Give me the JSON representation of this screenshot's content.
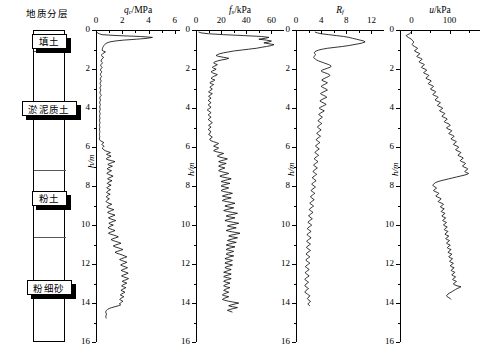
{
  "geology": {
    "title": "地质分层",
    "layers": [
      {
        "label": "填土",
        "top_m": 0.0,
        "bottom_m": 1.1
      },
      {
        "label": "淤泥质土",
        "top_m": 1.1,
        "bottom_m": 7.2
      },
      {
        "label": "粉土",
        "top_m": 7.2,
        "bottom_m": 10.6
      },
      {
        "label": "粉细砂",
        "top_m": 10.6,
        "bottom_m": 16.0
      }
    ],
    "label_depths_m": [
      0.55,
      4.0,
      8.6,
      13.2
    ]
  },
  "depth_axis": {
    "label": "h/m",
    "min": 0,
    "max": 16,
    "ticks": [
      0,
      2,
      4,
      6,
      8,
      10,
      12,
      14,
      16
    ],
    "minor_step": 1
  },
  "chart_data": [
    {
      "type": "line",
      "title": "q",
      "title_sub": "c",
      "title_unit": "/MPa",
      "xlabel": "q_c/MPa",
      "ylabel": "h/m",
      "xlim": [
        0,
        6.4
      ],
      "ylim": [
        0,
        16
      ],
      "xticks": [
        0,
        2,
        4,
        6
      ],
      "xminor": [
        1,
        3,
        5
      ],
      "grid": false,
      "x": [
        0.05,
        0.1,
        0.25,
        0.45,
        1.6,
        3.4,
        4.3,
        3.9,
        3.1,
        2.1,
        1.45,
        1.05,
        0.85,
        0.72,
        0.66,
        0.6,
        0.56,
        0.52,
        0.5,
        0.48,
        0.46,
        0.55,
        0.72,
        0.62,
        0.5,
        0.44,
        0.42,
        0.46,
        0.58,
        0.52,
        0.44,
        0.4,
        0.38,
        0.42,
        0.5,
        0.44,
        0.38,
        0.36,
        0.4,
        0.46,
        0.42,
        0.36,
        0.34,
        0.38,
        0.44,
        0.4,
        0.35,
        0.33,
        0.36,
        0.42,
        0.38,
        0.34,
        0.32,
        0.35,
        0.4,
        0.36,
        0.33,
        0.31,
        0.34,
        0.38,
        0.35,
        0.32,
        0.3,
        0.33,
        0.37,
        0.34,
        0.31,
        0.3,
        0.32,
        0.36,
        0.4,
        0.34,
        0.3,
        0.29,
        0.31,
        0.35,
        0.32,
        0.29,
        0.28,
        0.3,
        0.34,
        0.31,
        0.29,
        0.28,
        0.3,
        0.33,
        0.3,
        0.28,
        0.27,
        0.29,
        0.32,
        0.3,
        0.28,
        0.27,
        0.29,
        0.31,
        0.29,
        0.27,
        0.27,
        0.28,
        0.31,
        0.29,
        0.27,
        0.26,
        0.28,
        0.3,
        0.28,
        0.27,
        0.26,
        0.28,
        0.3,
        0.28,
        0.27,
        0.26,
        0.27,
        0.29,
        0.28,
        0.26,
        0.26,
        0.28,
        0.34,
        0.46,
        0.6,
        0.52,
        0.44,
        0.5,
        0.62,
        0.55,
        0.48,
        0.52,
        0.6,
        0.7,
        0.9,
        1.1,
        0.95,
        0.8,
        0.95,
        1.15,
        1.0,
        0.85,
        0.78,
        0.92,
        1.2,
        1.45,
        1.25,
        1.05,
        0.9,
        1.0,
        1.25,
        1.1,
        0.92,
        0.85,
        0.98,
        1.18,
        1.05,
        0.9,
        0.82,
        0.95,
        1.12,
        1.3,
        1.15,
        0.98,
        0.88,
        1.02,
        1.22,
        1.08,
        0.92,
        0.85,
        0.98,
        1.15,
        1.0,
        0.88,
        0.82,
        0.95,
        1.1,
        0.96,
        0.86,
        0.8,
        0.92,
        1.08,
        0.94,
        0.84,
        0.78,
        0.88,
        1.02,
        0.9,
        0.82,
        0.76,
        0.86,
        1.0,
        1.2,
        1.05,
        0.9,
        0.82,
        0.94,
        1.15,
        1.35,
        1.18,
        1.0,
        0.88,
        1.0,
        1.22,
        1.45,
        1.28,
        1.1,
        0.95,
        1.08,
        1.3,
        1.5,
        1.32,
        1.12,
        0.98,
        1.1,
        1.32,
        1.15,
        1.0,
        0.92,
        1.05,
        1.25,
        1.45,
        1.28,
        1.08,
        0.95,
        1.1,
        1.35,
        1.55,
        1.7,
        1.5,
        1.3,
        1.15,
        1.28,
        1.5,
        1.72,
        1.9,
        1.7,
        1.48,
        1.32,
        1.45,
        1.68,
        1.88,
        2.05,
        1.85,
        1.62,
        1.45,
        1.58,
        1.8,
        2.0,
        2.18,
        2.35,
        2.15,
        1.95,
        1.8,
        1.95,
        2.15,
        2.35,
        2.2,
        2.0,
        1.88,
        2.02,
        2.22,
        2.4,
        2.25,
        2.05,
        1.92,
        2.08,
        2.28,
        2.45,
        2.3,
        2.1,
        1.95,
        2.1,
        2.3,
        2.48,
        2.35,
        2.15,
        2.0,
        2.15,
        2.35,
        2.2,
        2.05,
        1.95,
        2.1,
        2.28,
        2.15,
        2.0,
        1.9,
        2.05,
        2.2,
        2.08,
        1.95,
        1.85,
        1.98,
        2.12,
        2.0,
        1.88,
        1.8,
        1.92,
        2.05,
        1.95,
        1.85,
        1.78,
        1.88,
        1.7,
        1.45,
        1.2,
        1.0,
        0.88,
        0.8,
        0.76,
        0.74,
        0.76,
        0.8,
        0.78,
        0.76,
        0.75,
        0.76,
        0.78
      ],
      "y_start": 0.1,
      "y_step": 0.0465
    },
    {
      "type": "line",
      "title": "f",
      "title_sub": "s",
      "title_unit": "/kPa",
      "xlabel": "f_s/kPa",
      "ylabel": "h/m",
      "xlim": [
        0,
        70
      ],
      "ylim": [
        0,
        16
      ],
      "xticks": [
        0,
        20,
        40,
        60
      ],
      "xminor": [
        10,
        30,
        50
      ],
      "grid": false,
      "x": [
        2,
        4,
        10,
        22,
        38,
        52,
        58,
        55,
        50,
        56,
        60,
        58,
        54,
        58,
        62,
        60,
        56,
        52,
        48,
        42,
        36,
        30,
        26,
        22,
        19,
        17,
        16,
        18,
        22,
        26,
        24,
        20,
        17,
        15,
        14,
        15,
        17,
        16,
        14,
        13,
        14,
        16,
        15,
        13,
        12,
        13,
        15,
        17,
        16,
        14,
        13,
        12,
        13,
        15,
        14,
        12,
        11,
        12,
        14,
        13,
        12,
        11,
        12,
        13,
        12,
        11,
        10,
        11,
        13,
        12,
        11,
        10,
        11,
        12,
        11,
        10,
        10,
        11,
        12,
        11,
        10,
        10,
        11,
        12,
        11,
        10,
        9,
        10,
        11,
        12,
        11,
        10,
        10,
        11,
        12,
        11,
        10,
        10,
        11,
        12,
        13,
        12,
        11,
        10,
        11,
        12,
        11,
        10,
        10,
        11,
        12,
        11,
        11,
        10,
        11,
        12,
        13,
        12,
        11,
        11,
        12,
        14,
        16,
        18,
        17,
        15,
        14,
        16,
        18,
        17,
        15,
        14,
        16,
        19,
        22,
        20,
        18,
        17,
        19,
        22,
        25,
        23,
        20,
        18,
        20,
        24,
        22,
        19,
        18,
        20,
        23,
        21,
        19,
        18,
        20,
        23,
        26,
        24,
        21,
        19,
        21,
        25,
        28,
        25,
        22,
        20,
        23,
        27,
        24,
        21,
        20,
        23,
        26,
        24,
        21,
        20,
        22,
        26,
        29,
        26,
        23,
        21,
        24,
        28,
        25,
        22,
        21,
        24,
        28,
        31,
        28,
        25,
        23,
        26,
        30,
        27,
        24,
        22,
        25,
        29,
        33,
        30,
        26,
        24,
        27,
        31,
        28,
        25,
        23,
        26,
        30,
        34,
        31,
        27,
        25,
        28,
        32,
        29,
        26,
        24,
        27,
        31,
        35,
        32,
        28,
        26,
        29,
        33,
        30,
        27,
        25,
        28,
        32,
        29,
        26,
        24,
        27,
        31,
        28,
        25,
        24,
        27,
        30,
        28,
        25,
        24,
        26,
        30,
        27,
        25,
        23,
        26,
        29,
        27,
        24,
        23,
        26,
        29,
        27,
        24,
        23,
        25,
        28,
        26,
        24,
        22,
        25,
        28,
        26,
        23,
        22,
        25,
        28,
        26,
        23,
        22,
        24,
        27,
        25,
        23,
        22,
        24,
        27,
        25,
        23,
        22,
        24,
        26,
        24,
        22,
        21,
        23,
        26,
        24,
        22,
        21,
        23,
        26,
        30,
        34,
        31,
        28,
        26,
        29,
        33,
        30,
        27,
        25,
        27,
        29
      ],
      "y_start": 0.1,
      "y_step": 0.0465
    },
    {
      "type": "line",
      "title": "R",
      "title_sub": "f",
      "title_unit": "",
      "xlabel": "R_f",
      "ylabel": "h/m",
      "xlim": [
        0,
        14
      ],
      "ylim": [
        0,
        16
      ],
      "xticks": [
        0,
        4,
        8,
        12
      ],
      "xminor": [
        2,
        6,
        10
      ],
      "grid": false,
      "x": [
        3.0,
        3.4,
        4.0,
        5.2,
        6.4,
        7.6,
        8.4,
        9.0,
        9.6,
        10.2,
        10.8,
        11.0,
        10.6,
        10.0,
        9.2,
        8.4,
        7.4,
        6.2,
        5.0,
        4.2,
        3.6,
        3.2,
        3.0,
        2.9,
        3.0,
        3.1,
        3.0,
        2.9,
        2.8,
        2.9,
        3.1,
        3.3,
        3.6,
        4.0,
        4.4,
        4.8,
        5.2,
        5.5,
        5.6,
        5.4,
        5.0,
        4.6,
        4.2,
        4.0,
        4.2,
        4.6,
        5.0,
        5.3,
        5.4,
        5.2,
        4.9,
        4.6,
        4.3,
        4.1,
        4.3,
        4.7,
        5.0,
        4.8,
        4.5,
        4.2,
        4.0,
        4.2,
        4.5,
        4.8,
        5.0,
        4.7,
        4.4,
        4.1,
        3.9,
        4.1,
        4.4,
        4.7,
        4.9,
        4.6,
        4.3,
        4.0,
        3.8,
        4.0,
        4.3,
        4.6,
        4.8,
        4.5,
        4.2,
        3.9,
        3.7,
        3.9,
        4.2,
        4.5,
        4.3,
        4.0,
        3.8,
        3.6,
        3.8,
        4.0,
        4.2,
        4.0,
        3.8,
        3.6,
        3.5,
        3.7,
        3.9,
        4.1,
        3.9,
        3.7,
        3.5,
        3.4,
        3.6,
        3.8,
        4.0,
        3.8,
        3.6,
        3.4,
        3.3,
        3.5,
        3.7,
        3.9,
        3.7,
        3.5,
        3.3,
        3.2,
        3.4,
        3.6,
        3.8,
        3.6,
        3.4,
        3.2,
        3.1,
        3.3,
        3.5,
        3.7,
        3.5,
        3.3,
        3.1,
        3.0,
        3.2,
        3.4,
        3.6,
        3.4,
        3.2,
        3.0,
        2.9,
        3.1,
        3.3,
        3.5,
        3.3,
        3.1,
        2.9,
        2.8,
        3.0,
        3.2,
        3.4,
        3.2,
        3.0,
        2.8,
        2.7,
        2.9,
        3.1,
        3.3,
        3.1,
        2.9,
        2.7,
        2.6,
        2.8,
        3.0,
        3.2,
        3.0,
        2.8,
        2.6,
        2.5,
        2.7,
        2.9,
        3.1,
        2.9,
        2.7,
        2.5,
        2.4,
        2.6,
        2.8,
        3.0,
        2.8,
        2.6,
        2.4,
        2.3,
        2.5,
        2.7,
        2.9,
        2.7,
        2.5,
        2.3,
        2.2,
        2.4,
        2.6,
        2.8,
        2.6,
        2.4,
        2.2,
        2.1,
        2.3,
        2.5,
        2.7,
        2.5,
        2.3,
        2.1,
        2.0,
        2.2,
        2.4,
        2.6,
        2.4,
        2.2,
        2.0,
        1.9,
        2.1,
        2.3,
        2.5,
        2.3,
        2.1,
        1.9,
        1.8,
        2.0,
        2.2,
        2.4,
        2.2,
        2.0,
        1.8,
        1.8,
        2.0,
        2.2,
        2.4,
        2.2,
        2.0,
        1.8,
        1.7,
        1.9,
        2.1,
        2.3,
        2.1,
        1.9,
        1.7,
        1.7,
        1.9,
        2.1,
        2.3,
        2.1,
        1.9,
        1.7,
        1.6,
        1.8,
        2.0,
        2.2,
        2.0,
        1.8,
        1.6,
        1.6,
        1.8,
        2.0,
        2.2,
        2.0,
        1.8,
        1.6,
        1.5,
        1.7,
        1.9,
        2.1,
        1.9,
        1.7,
        1.5,
        1.5,
        1.7,
        1.9,
        2.1,
        1.9,
        1.7,
        1.5,
        1.4,
        1.6,
        1.8,
        2.0,
        1.8,
        1.6,
        1.5,
        1.4,
        1.6,
        1.8,
        2.0,
        1.8,
        1.6,
        1.5,
        1.4,
        1.6,
        1.8,
        2.0,
        2.2,
        2.1,
        1.9,
        1.8,
        1.9,
        2.1,
        2.3,
        2.2,
        2.0,
        1.9,
        2.0,
        2.2
      ],
      "y_start": 0.1,
      "y_step": 0.0465
    },
    {
      "type": "line",
      "title": "u/kPa",
      "title_sub": "",
      "title_unit": "",
      "xlabel": "u/kPa",
      "ylabel": "h/m",
      "xlim": [
        -30,
        180
      ],
      "ylim": [
        0,
        16
      ],
      "xticks": [
        0,
        100
      ],
      "xminor": [
        50,
        150
      ],
      "grid": false,
      "x": [
        0,
        -2,
        -5,
        -10,
        -14,
        -12,
        -8,
        -4,
        0,
        2,
        4,
        6,
        5,
        3,
        2,
        4,
        8,
        12,
        16,
        14,
        10,
        8,
        12,
        18,
        22,
        20,
        16,
        14,
        18,
        24,
        28,
        26,
        22,
        20,
        24,
        30,
        34,
        32,
        28,
        26,
        30,
        36,
        40,
        38,
        34,
        32,
        36,
        42,
        46,
        44,
        40,
        38,
        42,
        48,
        52,
        50,
        46,
        44,
        48,
        54,
        58,
        56,
        52,
        50,
        54,
        60,
        64,
        62,
        58,
        56,
        60,
        66,
        70,
        68,
        64,
        62,
        66,
        72,
        76,
        74,
        70,
        68,
        72,
        78,
        82,
        80,
        76,
        74,
        78,
        84,
        88,
        86,
        82,
        80,
        84,
        90,
        94,
        92,
        88,
        86,
        90,
        96,
        100,
        102,
        98,
        94,
        92,
        96,
        102,
        106,
        104,
        100,
        98,
        102,
        108,
        112,
        110,
        106,
        104,
        108,
        114,
        118,
        116,
        112,
        110,
        114,
        120,
        124,
        122,
        118,
        116,
        120,
        126,
        130,
        128,
        124,
        122,
        126,
        132,
        136,
        134,
        130,
        128,
        132,
        138,
        142,
        140,
        136,
        134,
        138,
        144,
        148,
        146,
        142,
        140,
        144,
        150,
        146,
        138,
        128,
        118,
        108,
        98,
        88,
        78,
        70,
        64,
        60,
        58,
        56,
        58,
        62,
        66,
        64,
        60,
        58,
        62,
        68,
        72,
        70,
        66,
        64,
        68,
        74,
        78,
        76,
        72,
        70,
        74,
        80,
        84,
        82,
        78,
        76,
        80,
        86,
        84,
        80,
        78,
        82,
        88,
        86,
        82,
        80,
        84,
        90,
        88,
        84,
        82,
        86,
        92,
        90,
        86,
        84,
        88,
        94,
        92,
        88,
        86,
        90,
        96,
        94,
        90,
        88,
        92,
        98,
        96,
        92,
        90,
        94,
        100,
        98,
        94,
        92,
        96,
        102,
        100,
        96,
        94,
        98,
        104,
        102,
        98,
        96,
        100,
        106,
        104,
        100,
        98,
        102,
        108,
        106,
        102,
        100,
        104,
        110,
        108,
        104,
        102,
        106,
        112,
        110,
        106,
        104,
        108,
        114,
        112,
        108,
        106,
        110,
        116,
        114,
        110,
        108,
        112,
        118,
        116,
        112,
        110,
        114,
        120,
        130,
        126,
        120,
        116,
        112,
        108,
        104,
        100,
        96,
        94,
        92,
        94,
        98,
        102,
        104
      ],
      "y_start": 0.1,
      "y_step": 0.0465
    }
  ]
}
